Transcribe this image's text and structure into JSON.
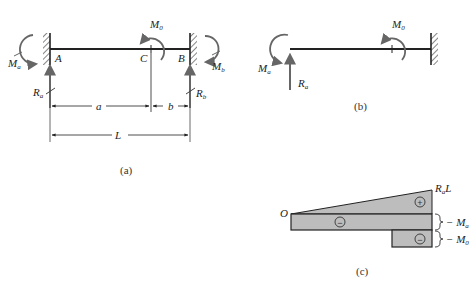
{
  "figure": {
    "panel_a": {
      "caption": "(a)",
      "support_left": "A",
      "point_c": "C",
      "support_right": "B",
      "moment_left": {
        "main": "M",
        "sub": "a"
      },
      "moment_applied": {
        "main": "M",
        "sub": "0"
      },
      "moment_right": {
        "main": "M",
        "sub": "b"
      },
      "reaction_left": {
        "main": "R",
        "sub": "a"
      },
      "reaction_right": {
        "main": "R",
        "sub": "b"
      },
      "dim_a": "a",
      "dim_b": "b",
      "dim_L": "L"
    },
    "panel_b": {
      "caption": "(b)",
      "moment_left": {
        "main": "M",
        "sub": "a"
      },
      "moment_applied": {
        "main": "M",
        "sub": "0"
      },
      "reaction_left": {
        "main": "R",
        "sub": "a"
      }
    },
    "panel_c": {
      "caption": "(c)",
      "origin": "O",
      "peak_label": {
        "main": "R",
        "sub": "a",
        "tail": "L"
      },
      "bracket_1": {
        "prefix": "− M",
        "sub": "a"
      },
      "bracket_2": {
        "prefix": "− M",
        "sub": "0"
      },
      "sign_triangle": "+",
      "sign_rect_1": "−",
      "sign_rect_2": "−"
    },
    "colors": {
      "line": "#222222",
      "arrow": "#666666",
      "fill": "#bdbdbd"
    }
  }
}
